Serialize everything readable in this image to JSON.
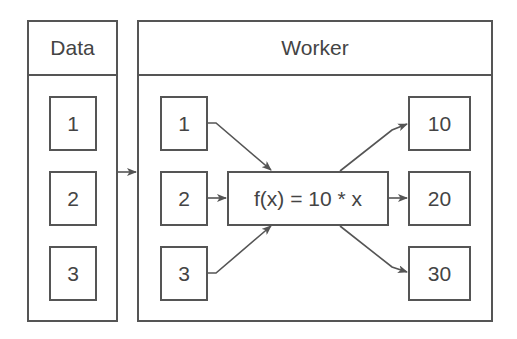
{
  "data_panel": {
    "title": "Data",
    "items": [
      "1",
      "2",
      "3"
    ]
  },
  "worker_panel": {
    "title": "Worker",
    "inputs": [
      "1",
      "2",
      "3"
    ],
    "function": "f(x) = 10 * x",
    "outputs": [
      "10",
      "20",
      "30"
    ]
  },
  "colors": {
    "stroke": "#555555",
    "text": "#444444",
    "background": "#ffffff"
  }
}
